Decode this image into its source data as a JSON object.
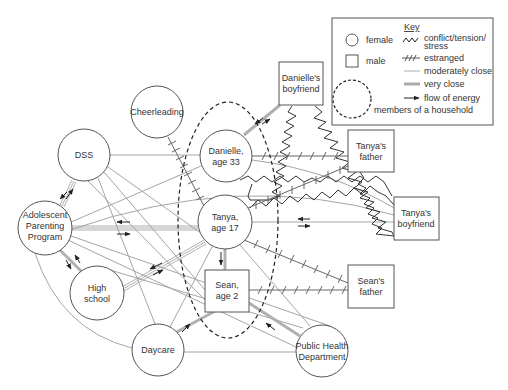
{
  "colors": {
    "line": "#9a9a9a",
    "very_close": "#aaaaaa",
    "conflict": "#333333",
    "estranged": "#666666",
    "node_stroke": "#555555",
    "text": "#333333"
  },
  "key": {
    "heading": "Key",
    "items": [
      {
        "symbol": "circle-icon",
        "label": "female"
      },
      {
        "symbol": "square-icon",
        "label": "male"
      },
      {
        "symbol": "zigzag-icon",
        "label_line1": "conflict/tension/",
        "label_line2": "stress"
      },
      {
        "symbol": "hatched-line-icon",
        "label": "estranged"
      },
      {
        "symbol": "thin-line-icon",
        "label": "moderately close"
      },
      {
        "symbol": "thick-line-icon",
        "label": "very close"
      },
      {
        "symbol": "arrow-icon",
        "label": "flow of energy"
      },
      {
        "symbol": "dashed-circle-icon",
        "label": "members of a household"
      }
    ]
  },
  "nodes": {
    "cheerleading": {
      "type": "circle",
      "lines": [
        "Cheerleading"
      ]
    },
    "dss": {
      "type": "circle",
      "lines": [
        "DSS"
      ]
    },
    "app": {
      "type": "circle",
      "lines": [
        "Adolescent",
        "Parenting",
        "Program"
      ]
    },
    "high_school": {
      "type": "circle",
      "lines": [
        "High",
        "school"
      ]
    },
    "daycare": {
      "type": "circle",
      "lines": [
        "Daycare"
      ]
    },
    "danielle": {
      "type": "circle",
      "lines": [
        "Danielle,",
        "age 33"
      ]
    },
    "tanya": {
      "type": "circle",
      "lines": [
        "Tanya,",
        "age 17"
      ]
    },
    "sean": {
      "type": "square",
      "lines": [
        "Sean,",
        "age 2"
      ]
    },
    "public_health": {
      "type": "circle",
      "lines": [
        "Public Health",
        "Department"
      ]
    },
    "danielles_boyfriend": {
      "type": "square",
      "lines": [
        "Danielle's",
        "boyfriend"
      ]
    },
    "tanyas_father": {
      "type": "square",
      "lines": [
        "Tanya's",
        "father"
      ]
    },
    "tanyas_boyfriend": {
      "type": "square",
      "lines": [
        "Tanya's",
        "boyfriend"
      ]
    },
    "seans_father": {
      "type": "square",
      "lines": [
        "Sean's",
        "father"
      ]
    }
  },
  "household_members": [
    "Danielle, age 33",
    "Tanya, age 17",
    "Sean, age 2"
  ]
}
